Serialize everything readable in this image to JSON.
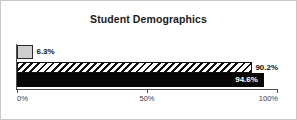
{
  "chart_data": {
    "type": "bar",
    "orientation": "horizontal",
    "title": "Student Demographics",
    "xlabel": "",
    "ylabel": "",
    "xlim": [
      0,
      100
    ],
    "grid": false,
    "legend": "none",
    "tick_labels": [
      "0%",
      "50%",
      "100%"
    ],
    "tick_values": [
      0,
      50,
      100
    ],
    "categories": [
      "Series 1",
      "Series 2",
      "Series 3"
    ],
    "values": [
      6.3,
      90.2,
      94.6
    ],
    "series": [
      {
        "name": "Series 1",
        "value": 6.3,
        "data_label": "6.3%",
        "style": "solid-light-gray",
        "color": "#cfcfcf",
        "label_position": "outside"
      },
      {
        "name": "Series 2",
        "value": 90.2,
        "data_label": "90.2%",
        "style": "diagonal-hatch",
        "color": "#111111",
        "label_position": "outside"
      },
      {
        "name": "Series 3",
        "value": 94.6,
        "data_label": "94.6%",
        "style": "solid-black",
        "color": "#070707",
        "label_position": "inside"
      }
    ]
  },
  "frame": {
    "border_color": "#c8c8c8",
    "background": "#ffffff",
    "axis_color": "#4d4d4d"
  }
}
